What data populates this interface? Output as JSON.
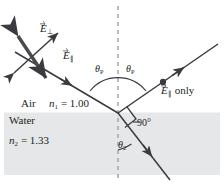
{
  "figure": {
    "media": {
      "upper": {
        "name": "Air",
        "index_label": "n",
        "index_sub": "1",
        "index_value": "= 1.00"
      },
      "lower": {
        "name": "Water",
        "index_label": "n",
        "index_sub": "2",
        "index_value": "= 1.33"
      }
    },
    "labels": {
      "e_perp": {
        "symbol": "E",
        "sub": "⊥"
      },
      "e_par": {
        "symbol": "E",
        "sub": "∥"
      },
      "e_par_only": {
        "symbol": "E",
        "sub": "∥",
        "text": "only"
      },
      "theta_p_incident": {
        "symbol": "θ",
        "sub": "P"
      },
      "theta_p_reflected": {
        "symbol": "θ",
        "sub": "P"
      },
      "theta_refracted": {
        "symbol": "θ",
        "sub": "2"
      },
      "right_angle": "90°"
    },
    "colors": {
      "ink": "#231f20",
      "water_fill": "#e6e7e8",
      "normal_dash": "#a7a9ac",
      "background": "#ffffff"
    },
    "elements": {
      "normal_line": "vertical dashed normal",
      "incident_ray": "incident ray from upper left",
      "reflected_ray": "reflected ray to upper right",
      "refracted_ray": "refracted ray into water, lower right",
      "right_angle_marker": "square marker between reflected and refracted rays",
      "polarization_dot": "dot on reflected ray"
    }
  }
}
